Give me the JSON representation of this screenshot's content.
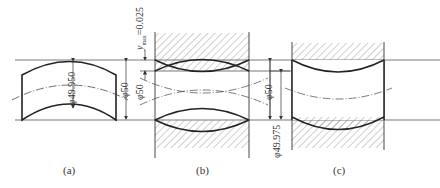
{
  "figure": {
    "panels": [
      {
        "id": "a",
        "caption": "(a)",
        "dims": {
          "inner": "φ49.950",
          "outer": "φ50"
        }
      },
      {
        "id": "b",
        "caption": "(b)",
        "dims": {
          "left_annot": "y",
          "left_annot_sub": "max",
          "left_annot_value": "=0.025",
          "left": "φ50",
          "right": "φ50"
        }
      },
      {
        "id": "c",
        "caption": "(c)",
        "dims": {
          "outer": "φ50",
          "inner": "φ49.975"
        }
      }
    ],
    "colors": {
      "line": "#222222",
      "thin": "#555555",
      "hatch": "#777777",
      "background": "#ffffff"
    }
  }
}
